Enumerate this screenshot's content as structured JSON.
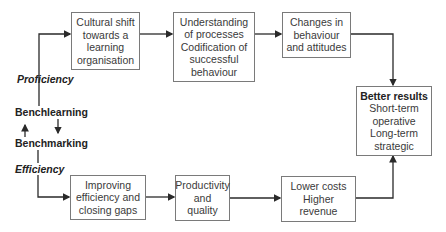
{
  "diagram": {
    "left_labels": {
      "proficiency": "Proficiency",
      "benchlearning": "Benchlearning",
      "benchmarking": "Benchmarking",
      "efficiency": "Efficiency"
    },
    "top_row": [
      {
        "lines": [
          "Cultural shift",
          "towards a",
          "learning",
          "organisation"
        ]
      },
      {
        "lines": [
          "Understanding",
          "of processes",
          "Codification of",
          "successful",
          "behaviour"
        ]
      },
      {
        "lines": [
          "Changes in",
          "behaviour",
          "and attitudes"
        ]
      }
    ],
    "bottom_row": [
      {
        "lines": [
          "Improving",
          "efficiency and",
          "closing gaps"
        ]
      },
      {
        "lines": [
          "Productivity",
          "and",
          "quality"
        ]
      },
      {
        "lines": [
          "Lower costs",
          "Higher",
          "revenue"
        ]
      }
    ],
    "result_box": {
      "title": "Better results",
      "lines": [
        "Short-term",
        "operative",
        "Long-term",
        "strategic"
      ]
    },
    "colors": {
      "line": "#2a2a2a",
      "box_border": "#7a7a7a",
      "text": "#3a3a3a"
    }
  }
}
